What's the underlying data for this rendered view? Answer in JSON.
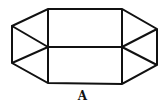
{
  "figure": {
    "label": "A",
    "stroke_color": "#111111",
    "background": "#ffffff"
  }
}
